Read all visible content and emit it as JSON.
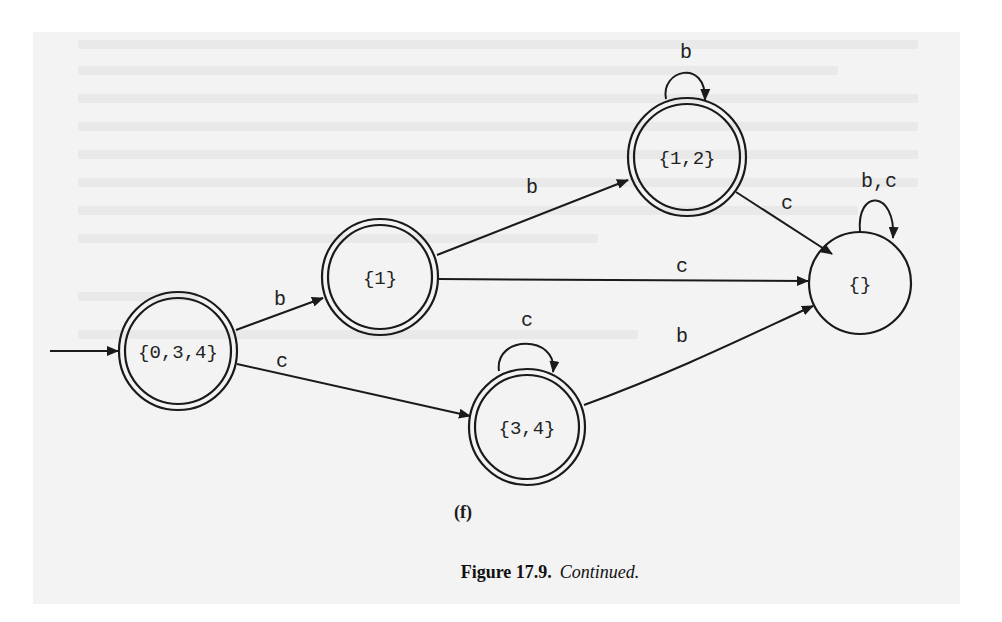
{
  "figure": {
    "sub_caption": "(f)",
    "caption_label": "Figure 17.9.",
    "caption_text": "Continued."
  },
  "diagram": {
    "type": "finite-state-automaton",
    "start_state": "{0,3,4}",
    "states": [
      {
        "id": "s034",
        "label": "{0,3,4}",
        "accepting": true,
        "start": true
      },
      {
        "id": "s1",
        "label": "{1}",
        "accepting": true
      },
      {
        "id": "s12",
        "label": "{1,2}",
        "accepting": true
      },
      {
        "id": "s34",
        "label": "{3,4}",
        "accepting": true
      },
      {
        "id": "sempty",
        "label": "{}",
        "accepting": false
      }
    ],
    "transitions": [
      {
        "from": "{0,3,4}",
        "to": "{1}",
        "label": "b"
      },
      {
        "from": "{0,3,4}",
        "to": "{3,4}",
        "label": "c"
      },
      {
        "from": "{1}",
        "to": "{1,2}",
        "label": "b"
      },
      {
        "from": "{1}",
        "to": "{}",
        "label": "c"
      },
      {
        "from": "{1,2}",
        "to": "{1,2}",
        "label": "b"
      },
      {
        "from": "{1,2}",
        "to": "{}",
        "label": "c"
      },
      {
        "from": "{3,4}",
        "to": "{3,4}",
        "label": "c"
      },
      {
        "from": "{3,4}",
        "to": "{}",
        "label": "b"
      },
      {
        "from": "{}",
        "to": "{}",
        "label": "b,c"
      }
    ]
  }
}
